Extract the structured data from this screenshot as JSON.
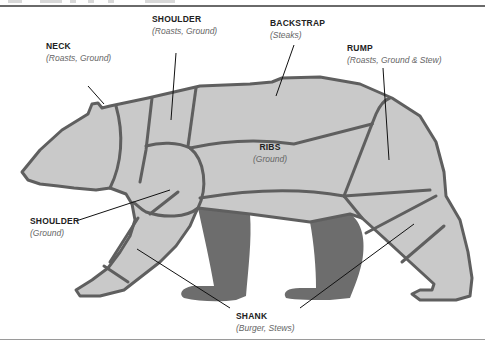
{
  "diagram": {
    "title_fragment_visible": true,
    "colors": {
      "body_fill": "#c9c9c9",
      "far_legs_fill": "#6d6d6d",
      "outline": "#5f5f5f",
      "leader_line": "#111111",
      "label_name": "#222222",
      "label_uses": "#666666"
    },
    "cuts": [
      {
        "id": "neck",
        "name": "NECK",
        "uses": "(Roasts, Ground)"
      },
      {
        "id": "shoulder-upper",
        "name": "SHOULDER",
        "uses": "(Roasts, Ground)"
      },
      {
        "id": "backstrap",
        "name": "BACKSTRAP",
        "uses": "(Steaks)"
      },
      {
        "id": "rump",
        "name": "RUMP",
        "uses": "(Roasts, Ground & Stew)"
      },
      {
        "id": "ribs",
        "name": "RIBS",
        "uses": "(Ground)"
      },
      {
        "id": "shoulder-lower",
        "name": "SHOULDER",
        "uses": "(Ground)"
      },
      {
        "id": "shank",
        "name": "SHANK",
        "uses": "(Burger, Stews)"
      }
    ]
  }
}
